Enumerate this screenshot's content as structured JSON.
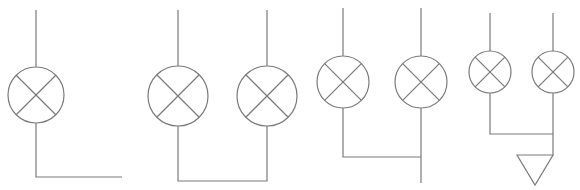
{
  "diagram": {
    "type": "electrical-schematic",
    "stroke_color": "#7a7a7a",
    "background": "#ffffff",
    "groups": [
      {
        "id": "single-lamp",
        "lamps": [
          {
            "cx": 36,
            "cy": 95,
            "r": 28
          }
        ],
        "wires": [
          [
            [
              36,
              10
            ],
            [
              36,
              67
            ]
          ],
          [
            [
              36,
              123
            ],
            [
              36,
              177
            ],
            [
              122,
              177
            ]
          ]
        ]
      },
      {
        "id": "two-lamps-closed-bus",
        "lamps": [
          {
            "cx": 178,
            "cy": 96,
            "r": 30
          },
          {
            "cx": 267,
            "cy": 96,
            "r": 30
          }
        ],
        "wires": [
          [
            [
              178,
              10
            ],
            [
              178,
              66
            ]
          ],
          [
            [
              267,
              10
            ],
            [
              267,
              66
            ]
          ],
          [
            [
              178,
              126
            ],
            [
              178,
              181
            ],
            [
              267,
              181
            ],
            [
              267,
              126
            ]
          ]
        ]
      },
      {
        "id": "two-lamps-common-lead",
        "lamps": [
          {
            "cx": 343,
            "cy": 82,
            "r": 26
          },
          {
            "cx": 421,
            "cy": 82,
            "r": 26
          }
        ],
        "wires": [
          [
            [
              343,
              8
            ],
            [
              343,
              56
            ]
          ],
          [
            [
              421,
              8
            ],
            [
              421,
              56
            ]
          ],
          [
            [
              343,
              108
            ],
            [
              343,
              157
            ],
            [
              421,
              157
            ]
          ],
          [
            [
              421,
              108
            ],
            [
              421,
              183
            ]
          ]
        ]
      },
      {
        "id": "two-lamps-grounded",
        "lamps": [
          {
            "cx": 490,
            "cy": 72,
            "r": 21
          },
          {
            "cx": 553,
            "cy": 72,
            "r": 21
          }
        ],
        "wires": [
          [
            [
              490,
              13
            ],
            [
              490,
              51
            ]
          ],
          [
            [
              553,
              13
            ],
            [
              553,
              51
            ]
          ],
          [
            [
              490,
              93
            ],
            [
              490,
              134
            ],
            [
              553,
              134
            ]
          ],
          [
            [
              553,
              93
            ],
            [
              553,
              155
            ]
          ]
        ],
        "ground": {
          "points": [
            [
              517,
              155
            ],
            [
              553,
              155
            ],
            [
              535,
              185
            ]
          ]
        }
      }
    ]
  }
}
